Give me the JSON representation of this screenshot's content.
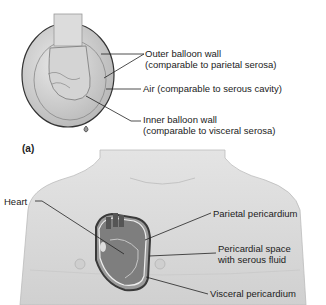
{
  "panel_a": {
    "label": "(a)",
    "callouts": [
      {
        "line1": "Outer balloon wall",
        "line2": "(comparable to parietal serosa)"
      },
      {
        "line1": "Air (comparable to serous cavity)"
      },
      {
        "line1": "Inner balloon wall",
        "line2": "(comparable to visceral serosa)"
      }
    ]
  },
  "panel_b": {
    "left_callout": "Heart",
    "callouts": [
      {
        "line1": "Parietal pericardium"
      },
      {
        "line1": "Pericardial space",
        "line2": "with serous fluid"
      },
      {
        "line1": "Visceral pericardium"
      }
    ]
  }
}
